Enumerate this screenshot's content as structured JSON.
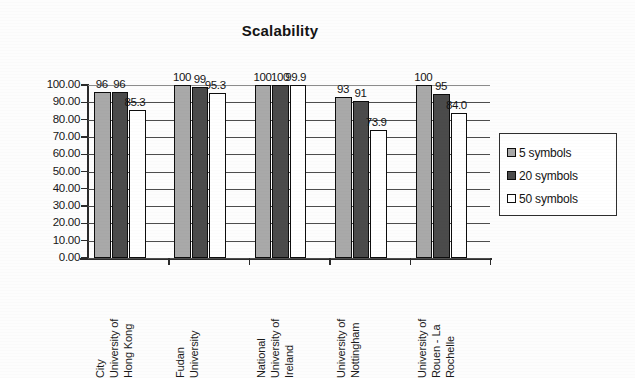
{
  "chart_data": {
    "type": "bar",
    "title": "Scalability",
    "xlabel": "",
    "ylabel": "",
    "ylim": [
      0,
      100
    ],
    "ytick_step": 10,
    "ytick_labels": [
      "100.00",
      "90.00",
      "80.00",
      "70.00",
      "60.00",
      "50.00",
      "40.00",
      "30.00",
      "20.00",
      "10.00",
      "0.00"
    ],
    "grid": true,
    "grid_axis": "y",
    "legend_position": "right",
    "categories": [
      "City University of Hong Kong",
      "Fudan University",
      "National University of Ireland",
      "University of Nottingham",
      "University of Rouen - La Rochelle"
    ],
    "category_lines": [
      [
        "City",
        "University of",
        "Hong Kong"
      ],
      [
        "Fudan",
        "University"
      ],
      [
        "National",
        "University of",
        "Ireland"
      ],
      [
        "University of",
        "Nottingham"
      ],
      [
        "University of",
        "Rouen - La",
        "Rochelle"
      ]
    ],
    "series": [
      {
        "name": "5 symbols",
        "color": "#a9a9a9",
        "values": [
          96,
          100,
          100,
          93,
          100
        ],
        "labels": [
          "96",
          "100",
          "100",
          "93",
          "100"
        ]
      },
      {
        "name": "20 symbols",
        "color": "#4b4b4b",
        "values": [
          96,
          99,
          100,
          91,
          95
        ],
        "labels": [
          "96",
          "99",
          "100",
          "91",
          "95"
        ]
      },
      {
        "name": "50 symbols",
        "color": "#ffffff",
        "values": [
          85.3,
          95.3,
          99.9,
          73.9,
          84.0
        ],
        "labels": [
          "85.3",
          "95.3",
          "99.9",
          "73.9",
          "84.0"
        ]
      }
    ]
  },
  "legend": {
    "items": [
      {
        "label": "5 symbols",
        "color": "#a9a9a9"
      },
      {
        "label": "20 symbols",
        "color": "#4b4b4b"
      },
      {
        "label": "50 symbols",
        "color": "#ffffff"
      }
    ]
  }
}
